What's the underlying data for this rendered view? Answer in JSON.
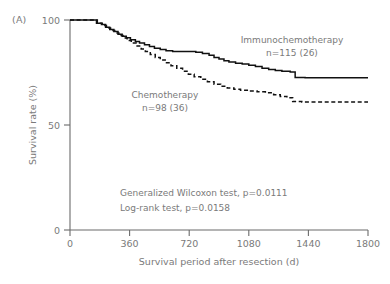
{
  "panel": {
    "label": "(A)"
  },
  "chart_data": {
    "type": "line",
    "subtype": "kaplan-meier-survival",
    "title": "",
    "xlabel": "Survival period after resection (d)",
    "ylabel": "Survival rate (%)",
    "xlim": [
      0,
      1800
    ],
    "ylim": [
      0,
      100
    ],
    "xticks": [
      0,
      360,
      720,
      1080,
      1440,
      1800
    ],
    "xtick_labels": [
      "0",
      "360",
      "720",
      "1080",
      "1440",
      "1800"
    ],
    "yticks": [
      0,
      50,
      100
    ],
    "ytick_labels": [
      "0",
      "50",
      "100"
    ],
    "grid": false,
    "legend_position": "inline-annotations",
    "series": [
      {
        "name": "Immunochemotherapy",
        "n": 115,
        "events": 26,
        "label_line1": "Immunochemotherapy",
        "label_line2": "n=115 (26)",
        "style": "solid",
        "color": "#111111",
        "final_survival": 72.5,
        "points": [
          [
            0,
            100
          ],
          [
            150,
            100
          ],
          [
            160,
            98.5
          ],
          [
            190,
            97.8
          ],
          [
            215,
            96.5
          ],
          [
            240,
            95.5
          ],
          [
            265,
            94.5
          ],
          [
            290,
            93.2
          ],
          [
            315,
            92.3
          ],
          [
            340,
            91.5
          ],
          [
            365,
            90.6
          ],
          [
            395,
            89.8
          ],
          [
            420,
            89.0
          ],
          [
            450,
            88.2
          ],
          [
            480,
            87.4
          ],
          [
            510,
            86.6
          ],
          [
            545,
            86.0
          ],
          [
            580,
            85.4
          ],
          [
            620,
            85.0
          ],
          [
            700,
            85.0
          ],
          [
            760,
            84.6
          ],
          [
            800,
            84.0
          ],
          [
            840,
            83.2
          ],
          [
            870,
            82.2
          ],
          [
            900,
            81.4
          ],
          [
            930,
            80.6
          ],
          [
            960,
            80.0
          ],
          [
            1000,
            79.4
          ],
          [
            1040,
            79.0
          ],
          [
            1080,
            78.4
          ],
          [
            1120,
            77.8
          ],
          [
            1160,
            77.0
          ],
          [
            1200,
            76.4
          ],
          [
            1240,
            76.0
          ],
          [
            1280,
            75.6
          ],
          [
            1330,
            75.2
          ],
          [
            1360,
            72.6
          ],
          [
            1420,
            72.5
          ],
          [
            1800,
            72.5
          ]
        ]
      },
      {
        "name": "Chemotherapy",
        "n": 98,
        "events": 36,
        "label_line1": "Chemotherapy",
        "label_line2": "n=98 (36)",
        "style": "dashed",
        "color": "#111111",
        "final_survival": 61.0,
        "points": [
          [
            0,
            100
          ],
          [
            150,
            100
          ],
          [
            165,
            98.4
          ],
          [
            195,
            97.4
          ],
          [
            220,
            96.2
          ],
          [
            245,
            95.0
          ],
          [
            270,
            93.8
          ],
          [
            295,
            92.6
          ],
          [
            320,
            91.4
          ],
          [
            345,
            90.2
          ],
          [
            370,
            89.0
          ],
          [
            400,
            87.6
          ],
          [
            430,
            86.2
          ],
          [
            455,
            85.0
          ],
          [
            485,
            83.6
          ],
          [
            515,
            82.2
          ],
          [
            545,
            81.0
          ],
          [
            575,
            79.6
          ],
          [
            610,
            78.2
          ],
          [
            645,
            77.0
          ],
          [
            680,
            75.6
          ],
          [
            715,
            74.2
          ],
          [
            750,
            73.0
          ],
          [
            790,
            71.8
          ],
          [
            830,
            70.6
          ],
          [
            870,
            69.4
          ],
          [
            910,
            68.4
          ],
          [
            950,
            67.6
          ],
          [
            990,
            67.0
          ],
          [
            1030,
            66.6
          ],
          [
            1080,
            66.2
          ],
          [
            1130,
            65.8
          ],
          [
            1180,
            65.4
          ],
          [
            1230,
            64.4
          ],
          [
            1270,
            63.6
          ],
          [
            1310,
            63.0
          ],
          [
            1345,
            61.2
          ],
          [
            1400,
            61.0
          ],
          [
            1800,
            61.0
          ]
        ]
      }
    ],
    "statistics": [
      {
        "test": "Generalized Wilcoxon test",
        "text": "Generalized Wilcoxon test, p=0.0111",
        "p_value": "0.0111"
      },
      {
        "test": "Log-rank test",
        "text": "Log-rank test, p=0.0158",
        "p_value": "0.0158"
      }
    ],
    "annotations": {
      "immunochemotherapy_x": 292,
      "immunochemotherapy_y": 43,
      "chemotherapy_x": 165,
      "chemotherapy_y": 98
    }
  }
}
